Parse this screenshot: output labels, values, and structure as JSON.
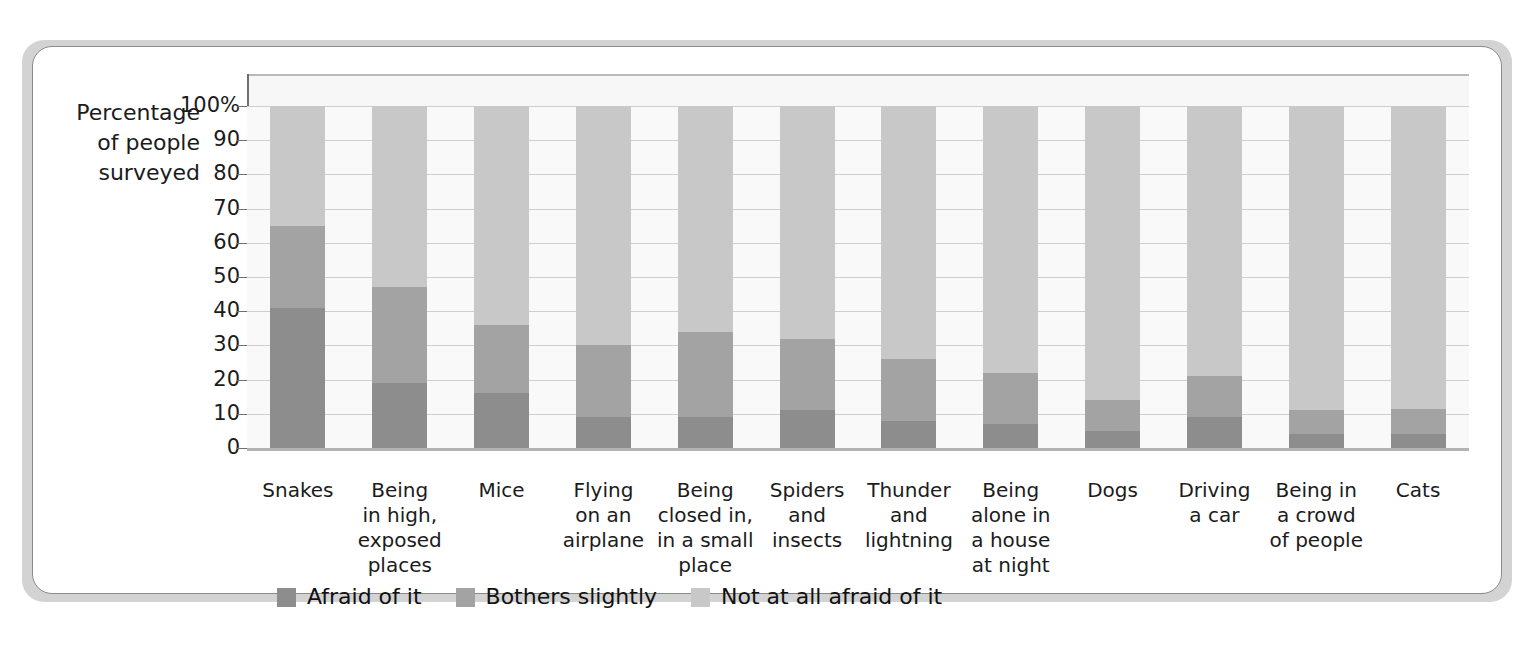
{
  "chart_data": {
    "type": "bar",
    "subtype": "stacked-bar-100",
    "title": "",
    "xlabel": "",
    "ylabel": "Percentage of people surveyed",
    "ylim": [
      0,
      100
    ],
    "yticks": [
      "0",
      "10",
      "20",
      "30",
      "40",
      "50",
      "60",
      "70",
      "80",
      "90",
      "100%"
    ],
    "grid": true,
    "legend_position": "bottom-left",
    "categories": [
      "Snakes",
      "Being in high, exposed places",
      "Mice",
      "Flying on an airplane",
      "Being closed in, in a small place",
      "Spiders and insects",
      "Thunder and lightning",
      "Being alone in a house at night",
      "Dogs",
      "Driving a car",
      "Being in a crowd of people",
      "Cats"
    ],
    "series": [
      {
        "name": "Afraid of it",
        "color": "#8d8d8d",
        "values": [
          41,
          19,
          16,
          9,
          9,
          11,
          8,
          7,
          5,
          9,
          4,
          4
        ]
      },
      {
        "name": "Bothers slightly",
        "color": "#a3a3a3",
        "values": [
          24,
          28,
          20,
          21,
          25,
          21,
          18,
          15,
          9,
          12,
          7,
          7.5
        ]
      },
      {
        "name": "Not at all afraid of it",
        "color": "#c8c8c8",
        "values": [
          35,
          53,
          64,
          70,
          66,
          68,
          74,
          78,
          86,
          79,
          89,
          88.5
        ]
      }
    ],
    "stack_tops": {
      "afraid_plus_slight": [
        65,
        47,
        36,
        30,
        34,
        32,
        26,
        22,
        14,
        21,
        11,
        11.5
      ]
    }
  },
  "y_axis_title_lines": [
    "Percentage",
    "of people",
    "surveyed"
  ],
  "category_labels": [
    [
      "Snakes"
    ],
    [
      "Being",
      "in high,",
      "exposed",
      "places"
    ],
    [
      "Mice"
    ],
    [
      "Flying",
      "on an",
      "airplane"
    ],
    [
      "Being",
      "closed in,",
      "in a small",
      "place"
    ],
    [
      "Spiders",
      "and",
      "insects"
    ],
    [
      "Thunder",
      "and",
      "lightning"
    ],
    [
      "Being",
      "alone in",
      "a house",
      "at night"
    ],
    [
      "Dogs"
    ],
    [
      "Driving",
      "a car"
    ],
    [
      "Being in",
      "a crowd",
      "of people"
    ],
    [
      "Cats"
    ]
  ],
  "legend": {
    "items": [
      {
        "label": "Afraid of it",
        "color": "#8d8d8d"
      },
      {
        "label": "Bothers slightly",
        "color": "#a3a3a3"
      },
      {
        "label": "Not at all afraid of it",
        "color": "#c8c8c8"
      }
    ]
  }
}
